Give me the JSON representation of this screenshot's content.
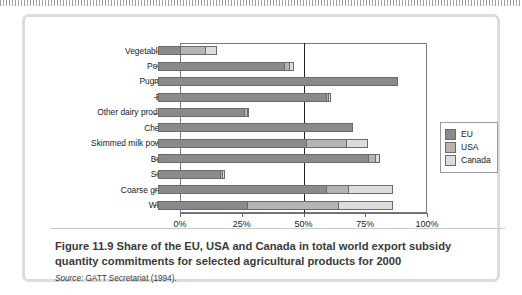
{
  "figure": {
    "caption_title": "Figure 11.9  Share of the EU, USA and Canada in total world export subsidy quantity commitments for selected agricultural products for 2000",
    "source_label": "Source:",
    "source_text": "GATT Secretariat (1994)."
  },
  "colors": {
    "eu": "#8a8a8a",
    "usa": "#b4b4b4",
    "canada": "#dcdcdc",
    "outline": "#6b6b6b",
    "frame": "#7a7a7a",
    "rule": "#222222",
    "card_border": "#dcdcdc"
  },
  "legend": {
    "position": "right",
    "items": [
      {
        "label": "EU",
        "color": "#8a8a8a"
      },
      {
        "label": "USA",
        "color": "#b4b4b4"
      },
      {
        "label": "Canada",
        "color": "#dcdcdc"
      }
    ]
  },
  "chart_data": {
    "type": "bar",
    "orientation": "horizontal",
    "stacked": true,
    "title": "Share of the EU, USA and Canada in total world export subsidy quantity commitments for selected agricultural products for 2000",
    "xlabel": "",
    "ylabel": "",
    "xlim": [
      0,
      100
    ],
    "xticks": [
      0,
      25,
      50,
      75,
      100
    ],
    "xtick_labels": [
      "0%",
      "25%",
      "50%",
      "75%",
      "100%"
    ],
    "grid": false,
    "reference_line": 50,
    "categories": [
      "Vegetable oil",
      "Poultry",
      "Pugmeat",
      "Beef",
      "Other dairy products",
      "Cheese",
      "Skimmed milk powder",
      "Butter",
      "Sugar",
      "Coarse grains",
      "Wheat"
    ],
    "series": [
      {
        "name": "EU",
        "values": [
          9,
          51,
          97,
          68,
          35,
          79,
          60,
          85,
          25,
          68,
          36
        ]
      },
      {
        "name": "USA",
        "values": [
          10,
          2,
          0,
          1,
          1,
          0,
          16,
          3,
          1,
          9,
          37
        ]
      },
      {
        "name": "Canada",
        "values": [
          5,
          2,
          0,
          1,
          1,
          0,
          9,
          2,
          1,
          18,
          22
        ]
      }
    ],
    "totals": [
      24,
      55,
      97,
      70,
      37,
      79,
      85,
      90,
      27,
      95,
      95
    ]
  }
}
